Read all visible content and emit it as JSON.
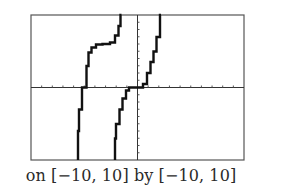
{
  "chart_data": {
    "type": "line",
    "title": "",
    "caption": "on [−10, 10] by [−10, 10]",
    "xlabel": "",
    "ylabel": "",
    "xlim": [
      -10,
      10
    ],
    "ylim": [
      -10,
      10
    ],
    "x_tick_step": 1,
    "y_tick_step": 1,
    "grid": false,
    "legend": null,
    "style": "graphing-calculator window, stepped pixel rendering",
    "series": [
      {
        "name": "left branch",
        "points": [
          [
            -5.6,
            -10
          ],
          [
            -5.5,
            -6
          ],
          [
            -5.2,
            -3
          ],
          [
            -4.8,
            0
          ],
          [
            -4.6,
            3
          ],
          [
            -4.3,
            4.8
          ],
          [
            -3.9,
            5.5
          ],
          [
            -3.3,
            5.9
          ],
          [
            -2.6,
            6.0
          ],
          [
            -2.1,
            6.2
          ],
          [
            -1.8,
            7.2
          ],
          [
            -1.6,
            8.5
          ],
          [
            -1.5,
            10
          ]
        ]
      },
      {
        "name": "middle branch",
        "points": [
          [
            -2.1,
            -10
          ],
          [
            -2.0,
            -7
          ],
          [
            -1.7,
            -5
          ],
          [
            -1.4,
            -3
          ],
          [
            -1.1,
            -1.5
          ],
          [
            -0.8,
            -0.4
          ],
          [
            -0.5,
            0
          ],
          [
            0,
            0
          ],
          [
            0.5,
            0
          ],
          [
            0.9,
            0.5
          ],
          [
            1.2,
            2
          ],
          [
            1.5,
            3.5
          ],
          [
            1.8,
            5
          ],
          [
            2.1,
            7
          ],
          [
            2.2,
            10
          ]
        ]
      }
    ]
  },
  "caption_text": "on [−10, 10] by [−10, 10]"
}
